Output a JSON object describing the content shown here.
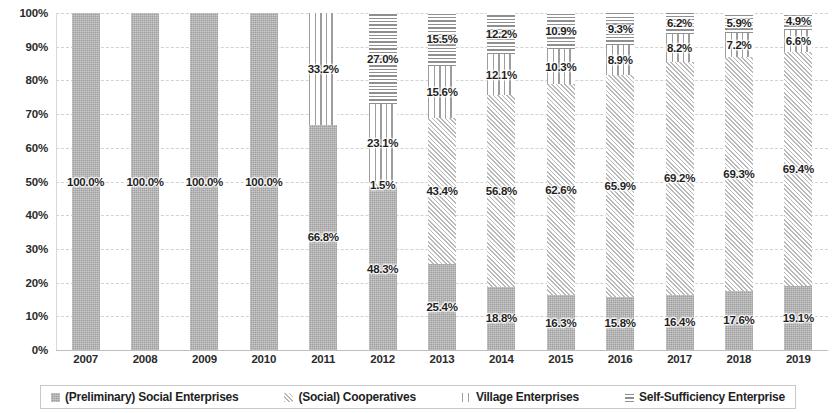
{
  "chart_data": {
    "type": "bar",
    "stacked": true,
    "stack_mode": "percent",
    "title": "",
    "subtitle": "",
    "xlabel": "",
    "ylabel": "",
    "ylim": [
      0,
      100
    ],
    "ytick_labels": [
      "0%",
      "10%",
      "20%",
      "30%",
      "40%",
      "50%",
      "60%",
      "70%",
      "80%",
      "90%",
      "100%"
    ],
    "ytick_values": [
      0,
      10,
      20,
      30,
      40,
      50,
      60,
      70,
      80,
      90,
      100
    ],
    "grid": true,
    "legend_position": "bottom",
    "categories": [
      "2007",
      "2008",
      "2009",
      "2010",
      "2011",
      "2012",
      "2013",
      "2014",
      "2015",
      "2016",
      "2017",
      "2018",
      "2019"
    ],
    "series": [
      {
        "name": "(Preliminary) Social Enterprises",
        "pattern": "solid",
        "color": "#b3b3b3",
        "values": [
          100.0,
          100.0,
          100.0,
          100.0,
          66.8,
          48.3,
          25.4,
          18.8,
          16.3,
          15.8,
          16.4,
          17.6,
          19.1
        ],
        "labels": [
          "100.0%",
          "100.0%",
          "100.0%",
          "100.0%",
          "66.8%",
          "48.3%",
          "25.4%",
          "18.8%",
          "16.3%",
          "15.8%",
          "16.4%",
          "17.6%",
          "19.1%"
        ]
      },
      {
        "name": "(Social) Cooperatives",
        "pattern": "diagonal",
        "color": "#b9b9b9",
        "values": [
          0,
          0,
          0,
          0,
          0,
          1.5,
          43.4,
          56.8,
          62.6,
          65.9,
          69.2,
          69.3,
          69.4
        ],
        "labels": [
          "",
          "",
          "",
          "",
          "",
          "1.5%",
          "43.4%",
          "56.8%",
          "62.6%",
          "65.9%",
          "69.2%",
          "69.3%",
          "69.4%"
        ]
      },
      {
        "name": "Village Enterprises",
        "pattern": "vertical",
        "color": "#9d9d9d",
        "values": [
          0,
          0,
          0,
          0,
          33.2,
          23.1,
          15.6,
          12.1,
          10.3,
          8.9,
          8.2,
          7.2,
          6.6
        ],
        "labels": [
          "",
          "",
          "",
          "",
          "33.2%",
          "23.1%",
          "15.6%",
          "12.1%",
          "10.3%",
          "8.9%",
          "8.2%",
          "7.2%",
          "6.6%"
        ]
      },
      {
        "name": "Self-Sufficiency Enterprise",
        "pattern": "horizontal",
        "color": "#8f8f8f",
        "values": [
          0,
          0,
          0,
          0,
          0,
          27.0,
          15.5,
          12.2,
          10.9,
          9.3,
          6.2,
          5.9,
          4.9
        ],
        "labels": [
          "",
          "",
          "",
          "",
          "",
          "27.0%",
          "15.5%",
          "12.2%",
          "10.9%",
          "9.3%",
          "6.2%",
          "5.9%",
          "4.9%"
        ]
      }
    ]
  },
  "legend": {
    "items": [
      {
        "label": "(Preliminary) Social Enterprises",
        "pattern": "solid"
      },
      {
        "label": "(Social) Cooperatives",
        "pattern": "diagonal"
      },
      {
        "label": "Village Enterprises",
        "pattern": "vertical"
      },
      {
        "label": "Self-Sufficiency Enterprise",
        "pattern": "horizontal"
      }
    ]
  }
}
